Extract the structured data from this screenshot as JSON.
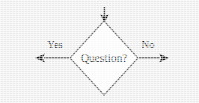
{
  "diagram": {
    "type": "flowchart",
    "background_color": "#f1f1f1",
    "stroke_color": "#4a4a4a",
    "text_color": "#1a1a1a",
    "node_fill": "#ffffff",
    "nodes": [
      {
        "id": "decision",
        "shape": "diamond",
        "label": "Question?",
        "cx": 104,
        "cy": 58,
        "half_width": 34,
        "half_height": 37
      }
    ],
    "edges": [
      {
        "id": "edge-in",
        "label": "",
        "direction": "down",
        "from": "external-top",
        "to": "decision",
        "arrowhead": "end"
      },
      {
        "id": "edge-yes",
        "label": "Yes",
        "direction": "left",
        "from": "decision",
        "to": "external-left",
        "arrowhead": "end"
      },
      {
        "id": "edge-no",
        "label": "No",
        "direction": "right",
        "from": "decision",
        "to": "external-right",
        "arrowhead": "end"
      }
    ],
    "labels": {
      "question": "Question?",
      "yes": "Yes",
      "no": "No"
    }
  }
}
